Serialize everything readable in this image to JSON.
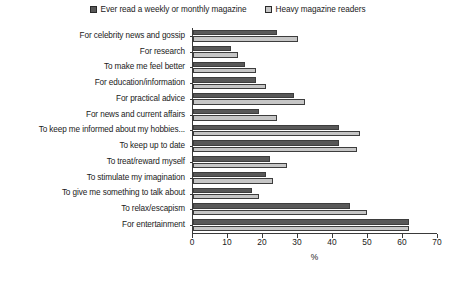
{
  "chart_data": {
    "type": "bar",
    "orientation": "horizontal",
    "title": "",
    "xlabel": "%",
    "ylabel": "",
    "xlim": [
      0,
      70
    ],
    "xticks": [
      0,
      10,
      20,
      30,
      40,
      50,
      60,
      70
    ],
    "grid": false,
    "legend_position": "top-center",
    "categories": [
      "For celebrity news and gossip",
      "For research",
      "To make me feel better",
      "For education/information",
      "For practical advice",
      "For news and current affairs",
      "To keep me informed about my hobbies...",
      "To keep up to date",
      "To treat/reward myself",
      "To stimulate my imagination",
      "To give me something to talk about",
      "To relax/escapism",
      "For entertainment"
    ],
    "series": [
      {
        "name": "Ever read a weekly or monthly magazine",
        "color": "#585858",
        "values": [
          24,
          11,
          15,
          18,
          29,
          19,
          42,
          42,
          22,
          21,
          17,
          45,
          62
        ]
      },
      {
        "name": "Heavy magazine readers",
        "color": "#c6c6c6",
        "values": [
          30,
          13,
          18,
          21,
          32,
          24,
          48,
          47,
          27,
          23,
          19,
          50,
          62
        ]
      }
    ]
  },
  "legend": {
    "items": [
      {
        "label": "Ever read a weekly or monthly magazine",
        "swatch": "dark-square-icon"
      },
      {
        "label": "Heavy magazine readers",
        "swatch": "light-square-icon"
      }
    ]
  }
}
